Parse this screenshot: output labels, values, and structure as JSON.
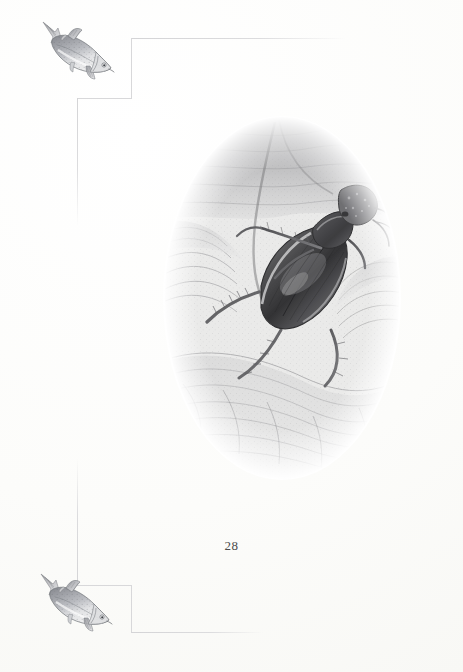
{
  "page": {
    "kind": "book-page",
    "folio": "28",
    "background_color": "#fdfdfc",
    "rule_color": "#d8d8da",
    "ink_color": "#4a4a4a"
  },
  "border": {
    "name": "stepped-decorative-rule",
    "segments": [
      {
        "id": "rule-top-horizontal",
        "orientation": "horizontal",
        "x": 131,
        "y": 38,
        "length": 215,
        "fade": "right"
      },
      {
        "id": "rule-top-vertical",
        "orientation": "vertical",
        "x": 131,
        "y": 38,
        "length": 61,
        "fade": "none"
      },
      {
        "id": "rule-top-step-h",
        "orientation": "horizontal",
        "x": 77,
        "y": 98,
        "length": 55,
        "fade": "none"
      },
      {
        "id": "rule-top-step-v",
        "orientation": "vertical",
        "x": 77,
        "y": 98,
        "length": 128,
        "fade": "bottom"
      },
      {
        "id": "rule-bot-step-v",
        "orientation": "vertical",
        "x": 77,
        "y": 458,
        "length": 128,
        "fade": "top"
      },
      {
        "id": "rule-bot-step-h",
        "orientation": "horizontal",
        "x": 77,
        "y": 585,
        "length": 55,
        "fade": "none"
      },
      {
        "id": "rule-bot-vertical",
        "orientation": "vertical",
        "x": 131,
        "y": 585,
        "length": 48,
        "fade": "none"
      },
      {
        "id": "rule-bot-horizontal",
        "orientation": "horizontal",
        "x": 131,
        "y": 632,
        "length": 132,
        "fade": "right"
      }
    ]
  },
  "illustrations": [
    {
      "id": "fish-top",
      "subject": "trout",
      "description": "pencil drawing of a trout, head down-right, tail up-left",
      "x": 38,
      "y": 16,
      "width": 80,
      "height": 76
    },
    {
      "id": "fish-bottom",
      "subject": "trout",
      "description": "pencil drawing of a trout, head down-right, tail up-left",
      "x": 36,
      "y": 568,
      "width": 80,
      "height": 76
    },
    {
      "id": "beetle-vignette",
      "subject": "great diving beetle underwater",
      "description": "oval pencil vignette of a water beetle among pondweed, with water surface above",
      "shape": "oval",
      "x": 163,
      "y": 116,
      "width": 238,
      "height": 364
    }
  ],
  "folio": {
    "label": "28"
  }
}
